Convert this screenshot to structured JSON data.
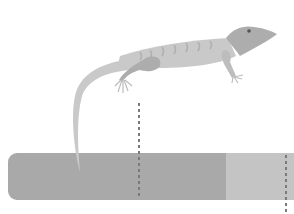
{
  "scene": {
    "description": "Grayscale illustration of a lizard above a horizontal band with two dashed vertical marker lines",
    "colors": {
      "background": "#ffffff",
      "band_dark": "#a9a9a9",
      "band_light": "#c4c4c4",
      "lizard_body": "#c9c9c9",
      "lizard_dark": "#adadad",
      "lizard_stripe": "#b4b4b4",
      "dash": "#7a7a7a",
      "eye": "#555555"
    },
    "band": {
      "x": 8,
      "y": 153,
      "width": 286,
      "height": 47,
      "split_x": 226
    },
    "markers": [
      {
        "x": 139,
        "y1": 103,
        "y2": 199
      },
      {
        "x": 286,
        "y1": 155,
        "y2": 214
      }
    ]
  }
}
